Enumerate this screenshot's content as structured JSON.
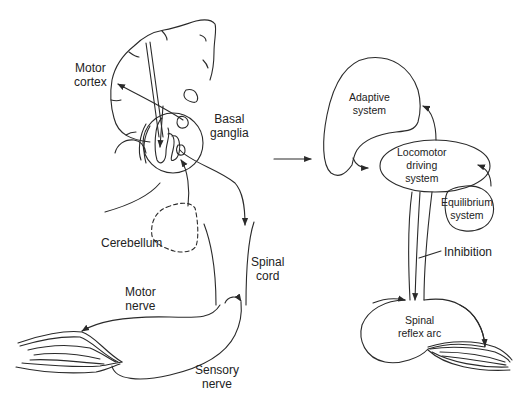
{
  "left_panel": {
    "labels": {
      "motor_cortex": [
        "Motor",
        "cortex"
      ],
      "basal_ganglia": [
        "Basal",
        "ganglia"
      ],
      "cerebellum": [
        "Cerebellum"
      ],
      "spinal_cord": [
        "Spinal",
        "cord"
      ],
      "motor_nerve": [
        "Motor",
        "nerve"
      ],
      "sensory_nerve": [
        "Sensory",
        "nerve"
      ]
    }
  },
  "right_panel": {
    "labels": {
      "adaptive_system": [
        "Adaptive",
        "system"
      ],
      "locomotor_driving_system": [
        "Locomotor",
        "driving",
        "system"
      ],
      "equilibrium_system": [
        "Equilibrium",
        "system"
      ],
      "inhibition": [
        "Inhibition"
      ],
      "spinal_reflex_arc": [
        "Spinal",
        "reflex arc"
      ]
    }
  },
  "colors": {
    "line": "#2a2a2a",
    "text": "#222222",
    "background": "#ffffff"
  }
}
